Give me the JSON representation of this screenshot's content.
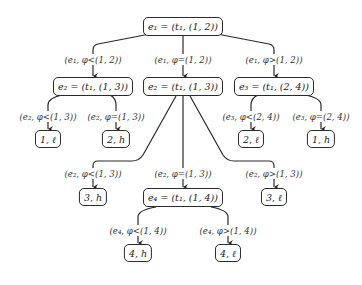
{
  "diagram": {
    "type": "tree",
    "nodes": {
      "root": "e₁ = (t₁, (1, 2))",
      "e2_left": "e₂ = (t₁, (1, 3))",
      "e2_mid": "e₂ = (t₁, (1, 3))",
      "e3": "e₃ = (t₁, (2, 4))",
      "leaf_1l": "1, ℓ",
      "leaf_2h": "2, h",
      "leaf_2l": "2, ℓ",
      "leaf_1h": "1, h",
      "leaf_3h": "3, h",
      "e4": "e₄ = (t₁, (1, 4))",
      "leaf_3l": "3, ℓ",
      "leaf_4h": "4, h",
      "leaf_4l": "4, ℓ"
    },
    "edges": {
      "root_to_e2_left": "(e₁, φ<(1, 2))",
      "root_to_e2_mid": "(e₁, φ=(1, 2))",
      "root_to_e3": "(e₁, φ>(1, 2))",
      "e2_left_to_1l": "(e₂, φ<(1, 3))",
      "e2_left_to_2h": "(e₂, φ=(1, 3))",
      "e3_to_2l": "(e₃, φ<(2, 4))",
      "e3_to_1h": "(e₃, φ=(2, 4))",
      "e2_mid_to_3h": "(e₂, φ<(1, 3))",
      "e2_mid_to_e4": "(e₂, φ=(1, 3))",
      "e2_mid_to_3l": "(e₂, φ>(1, 3))",
      "e4_to_4h": "(e₄, φ<(1, 4))",
      "e4_to_4l": "(e₄, φ>(1, 4))"
    }
  }
}
